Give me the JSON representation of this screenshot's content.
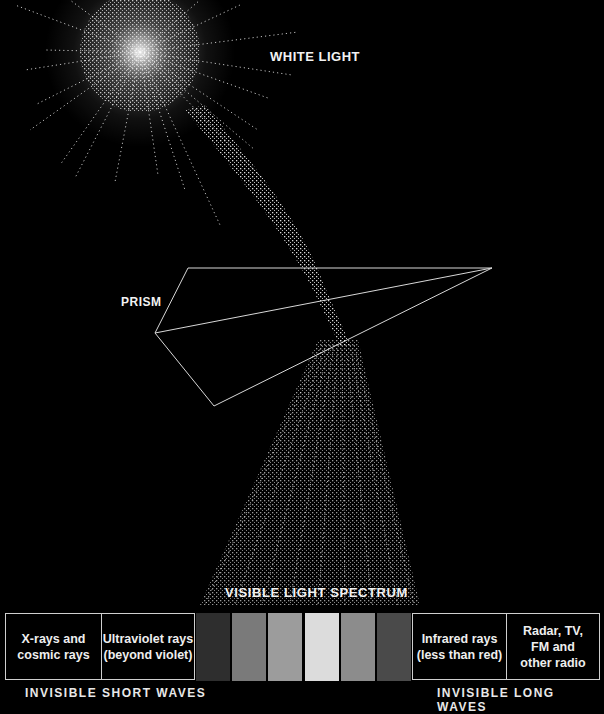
{
  "title_labels": {
    "white_light": "WHITE LIGHT",
    "prism": "PRISM",
    "visible_spectrum": "VISIBLE LIGHT SPECTRUM"
  },
  "short_wave_boxes": [
    {
      "line1": "X-rays and",
      "line2": "cosmic rays"
    },
    {
      "line1": "Ultraviolet rays",
      "line2": "(beyond violet)"
    }
  ],
  "spectrum_bands": [
    {
      "name": "band-1",
      "color": "#2e2e2e"
    },
    {
      "name": "band-2",
      "color": "#7a7a7a"
    },
    {
      "name": "band-3",
      "color": "#9c9c9c"
    },
    {
      "name": "band-4",
      "color": "#dcdcdc"
    },
    {
      "name": "band-5",
      "color": "#8c8c8c"
    },
    {
      "name": "band-6",
      "color": "#4a4a4a"
    }
  ],
  "long_wave_boxes": [
    {
      "line1": "Infrared rays",
      "line2": "(less than red)"
    },
    {
      "line1": "Radar, TV,",
      "line2": "FM and",
      "line3": "other radio"
    }
  ],
  "bottom_labels": {
    "short": "INVISIBLE SHORT WAVES",
    "long": "INVISIBLE LONG WAVES"
  },
  "colors": {
    "background": "#000000",
    "foreground": "#f2f2f2",
    "outline": "#cfcfcf"
  }
}
